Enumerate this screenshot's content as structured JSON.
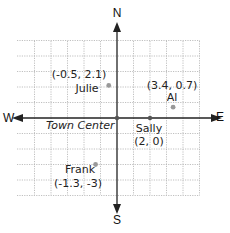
{
  "compass": {
    "north": "N",
    "south": "S",
    "east": "E",
    "west": "W"
  },
  "origin_label": "Town Center",
  "grid": {
    "x_min": -5,
    "x_max": 5,
    "y_min": -5,
    "y_max": 5,
    "line_color": "#b0b0b0",
    "axis_color": "#222222",
    "point_color": "#999999"
  },
  "points": [
    {
      "name": "Julie",
      "coords": "(-0.5, 2.1)",
      "x": -0.5,
      "y": 2.1
    },
    {
      "name": "Al",
      "coords": "(3.4, 0.7)",
      "x": 3.4,
      "y": 0.7
    },
    {
      "name": "Sally",
      "coords": "(2, 0)",
      "x": 2,
      "y": 0
    },
    {
      "name": "Frank",
      "coords": "(-1.3, -3)",
      "x": -1.3,
      "y": -3
    }
  ]
}
